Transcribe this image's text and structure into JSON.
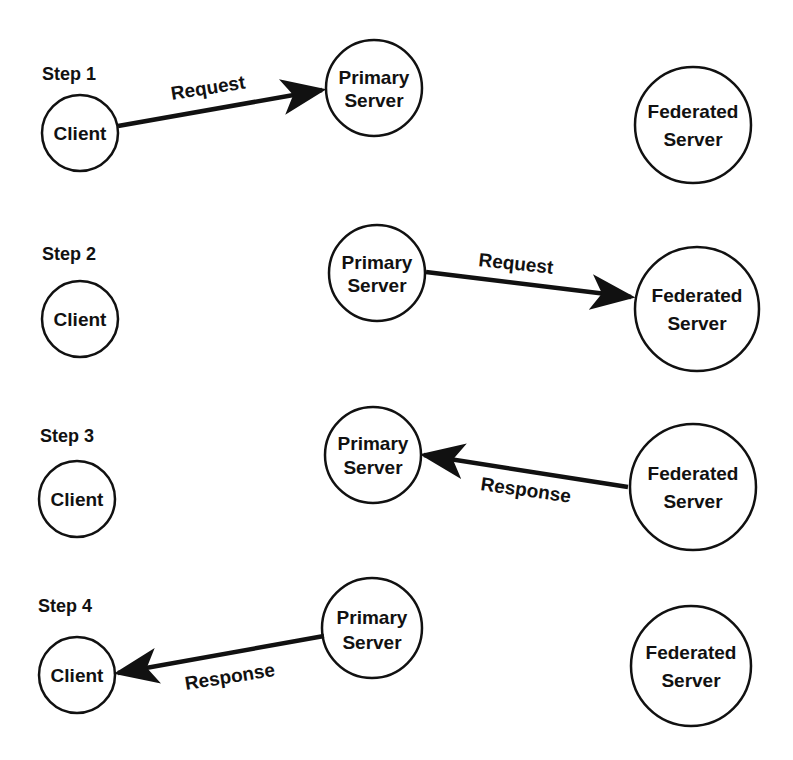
{
  "diagram": {
    "colors": {
      "stroke": "#111111",
      "background": "#ffffff"
    },
    "steps": [
      {
        "label": "Step 1",
        "nodes": {
          "client": {
            "line1": "Client"
          },
          "primary": {
            "line1": "Primary",
            "line2": "Server"
          },
          "federated": {
            "line1": "Federated",
            "line2": "Server"
          }
        },
        "edge": {
          "label": "Request",
          "from": "Client",
          "to": "Primary Server"
        }
      },
      {
        "label": "Step 2",
        "nodes": {
          "client": {
            "line1": "Client"
          },
          "primary": {
            "line1": "Primary",
            "line2": "Server"
          },
          "federated": {
            "line1": "Federated",
            "line2": "Server"
          }
        },
        "edge": {
          "label": "Request",
          "from": "Primary Server",
          "to": "Federated Server"
        }
      },
      {
        "label": "Step 3",
        "nodes": {
          "client": {
            "line1": "Client"
          },
          "primary": {
            "line1": "Primary",
            "line2": "Server"
          },
          "federated": {
            "line1": "Federated",
            "line2": "Server"
          }
        },
        "edge": {
          "label": "Response",
          "from": "Federated Server",
          "to": "Primary Server"
        }
      },
      {
        "label": "Step 4",
        "nodes": {
          "client": {
            "line1": "Client"
          },
          "primary": {
            "line1": "Primary",
            "line2": "Server"
          },
          "federated": {
            "line1": "Federated",
            "line2": "Server"
          }
        },
        "edge": {
          "label": "Response",
          "from": "Primary Server",
          "to": "Client"
        }
      }
    ]
  }
}
